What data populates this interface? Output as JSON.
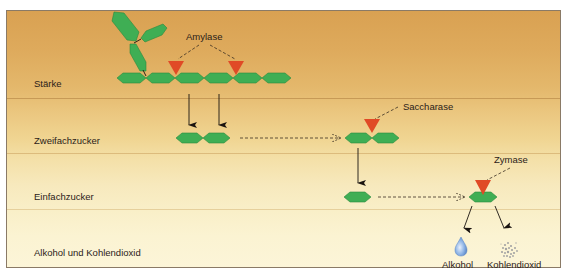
{
  "diagram": {
    "rows": [
      {
        "label": "Stärke"
      },
      {
        "label": "Zweifachzucker"
      },
      {
        "label": "Einfachzucker"
      },
      {
        "label": "Alkohol und  Kohlendioxid"
      }
    ],
    "enzymes": {
      "amylase": "Amylase",
      "saccharase": "Saccharase",
      "zymase": "Zymase"
    },
    "products": {
      "alcohol": "Alkohol",
      "co2": "Kohlendioxid"
    },
    "colors": {
      "sugar_unit": "#3fae54",
      "sugar_unit_dark": "#2a8a3e",
      "enzyme": "#e04a26",
      "arrow": "#1a1410",
      "dashed": "#3a2e22",
      "alcohol_drop": "#8fb5e6",
      "co2_cloud": "#a8a8a8",
      "divider": "#c9a266"
    }
  }
}
